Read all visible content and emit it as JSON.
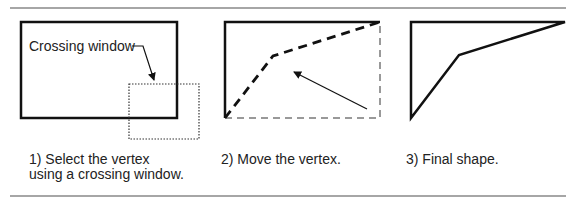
{
  "colors": {
    "stroke": "#111111",
    "rule": "#888888",
    "dashed_gray": "#999999",
    "text": "#222222",
    "background": "#ffffff"
  },
  "panel1": {
    "label": "Crossing window",
    "caption_line1": "1) Select the vertex",
    "caption_line2": "using a crossing window."
  },
  "panel2": {
    "caption": "2) Move the vertex."
  },
  "panel3": {
    "caption": "3) Final shape."
  }
}
